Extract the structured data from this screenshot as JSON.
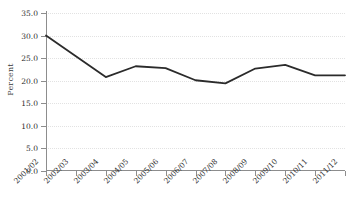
{
  "chart_data": {
    "type": "line",
    "title": "",
    "xlabel": "",
    "ylabel": "Percent",
    "categories": [
      "2001/02",
      "2002/03",
      "2003/04",
      "2004/05",
      "2005/06",
      "2006/07",
      "2007/08",
      "2008/09",
      "2009/10",
      "2010/11",
      "2011/12"
    ],
    "values": [
      30.0,
      25.4,
      20.8,
      23.2,
      22.8,
      20.1,
      19.4,
      22.7,
      23.5,
      21.2,
      21.2
    ],
    "series": [
      {
        "name": "Percent",
        "values": [
          30.0,
          25.4,
          20.8,
          23.2,
          22.8,
          20.1,
          19.4,
          22.7,
          23.5,
          21.2,
          21.2
        ]
      }
    ],
    "ylim": [
      0.0,
      35.0
    ],
    "ytick_step": 5.0,
    "ytick_labels": [
      "0.0",
      "5.0",
      "10.0",
      "15.0",
      "20.0",
      "25.0",
      "30.0",
      "35.0"
    ],
    "ytick_values": [
      0.0,
      5.0,
      10.0,
      15.0,
      20.0,
      25.0,
      30.0,
      35.0
    ],
    "grid": "horizontal",
    "legend": "none",
    "line_color": "#2b2b2b",
    "grid_color": "#e2e2e2",
    "axis_color": "#8d8d8d",
    "xtick_label_rotation": -45
  }
}
